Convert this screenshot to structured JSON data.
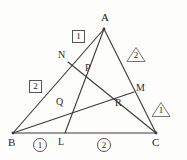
{
  "figure": {
    "type": "geometry-diagram",
    "stroke_color": "#3a3a3a",
    "background_color": "#fdfdfc",
    "vertices": [
      {
        "name": "A",
        "label": "A",
        "x": 104,
        "y": 29,
        "label_x": 101,
        "label_y": 12
      },
      {
        "name": "B",
        "label": "B",
        "x": 13,
        "y": 133,
        "label_x": 8,
        "label_y": 137
      },
      {
        "name": "C",
        "label": "C",
        "x": 156,
        "y": 133,
        "label_x": 152,
        "label_y": 137
      }
    ],
    "points": [
      {
        "name": "N",
        "label": "N",
        "x": 68,
        "y": 62,
        "label_x": 58,
        "label_y": 50
      },
      {
        "name": "M",
        "label": "M",
        "x": 134,
        "y": 92,
        "label_x": 136,
        "label_y": 83
      },
      {
        "name": "L",
        "label": "L",
        "x": 65,
        "y": 133,
        "label_x": 58,
        "label_y": 137
      },
      {
        "name": "P",
        "label": "P",
        "x": 86,
        "y": 72,
        "label_x": 85,
        "label_y": 63
      },
      {
        "name": "Q",
        "label": "Q",
        "x": 66,
        "y": 106,
        "label_x": 56,
        "label_y": 97
      },
      {
        "name": "R",
        "label": "R",
        "x": 119,
        "y": 106,
        "label_x": 115,
        "label_y": 98
      }
    ],
    "segments": [
      {
        "name": "side-AB",
        "from": "A",
        "to": "B"
      },
      {
        "name": "side-BC",
        "from": "B",
        "to": "C"
      },
      {
        "name": "side-CA",
        "from": "C",
        "to": "A"
      },
      {
        "name": "cevian-AL",
        "from": "A",
        "to": "L"
      },
      {
        "name": "cevian-BM",
        "from": "B",
        "to": "M"
      },
      {
        "name": "cevian-CN",
        "from": "C",
        "to": "N"
      }
    ],
    "annotations": {
      "boxed": [
        {
          "name": "boxed-label-1",
          "value": "1",
          "x": 72,
          "y": 30
        },
        {
          "name": "boxed-label-2",
          "value": "2",
          "x": 29,
          "y": 80
        }
      ],
      "circled": [
        {
          "name": "circled-label-1",
          "value": "1",
          "x": 33,
          "y": 138
        },
        {
          "name": "circled-label-2",
          "value": "2",
          "x": 97,
          "y": 138
        }
      ],
      "triangled": [
        {
          "name": "triangled-label-2",
          "value": "2",
          "x": 126,
          "y": 46
        },
        {
          "name": "triangled-label-1",
          "value": "1",
          "x": 151,
          "y": 101
        }
      ]
    }
  }
}
